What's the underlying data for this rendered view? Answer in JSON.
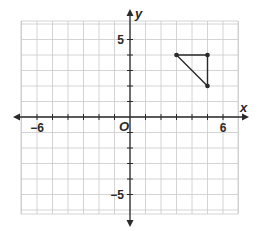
{
  "chart_data": {
    "type": "scatter",
    "title": "",
    "xlabel": "x",
    "ylabel": "y",
    "origin_label": "O",
    "xlim": [
      -7,
      7
    ],
    "ylim": [
      -6,
      6
    ],
    "grid": true,
    "x_tick_labels": [
      {
        "value": -6,
        "label": "−6"
      },
      {
        "value": 6,
        "label": "6"
      }
    ],
    "y_tick_labels": [
      {
        "value": 5,
        "label": "5"
      },
      {
        "value": -5,
        "label": "−5"
      }
    ],
    "polygon": {
      "name": "triangle",
      "vertices": [
        [
          3,
          4
        ],
        [
          5,
          4
        ],
        [
          5,
          2
        ]
      ],
      "closed": true
    }
  }
}
